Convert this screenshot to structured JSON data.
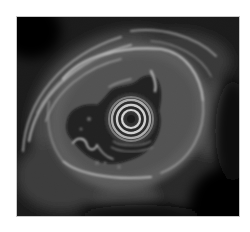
{
  "image": {
    "kind": "endoscopic ultrasound",
    "description": "Grayscale radial endoscopic ultrasound image showing a circular transducer artifact with concentric rings at center, surrounded by an irregular anechoic lumen and layered echogenic wall",
    "colors": {
      "background": "#ffffff",
      "field": "#050505",
      "tissue": "#6e6e6e",
      "bright_echo": "#d8d8d8",
      "ring_bright": "#e6e6e6",
      "ring_dark": "#0a0a0a"
    },
    "frame": {
      "x": 16,
      "y": 16,
      "width": 224,
      "height": 201
    },
    "transducer_center": {
      "x": 130,
      "y": 118
    }
  }
}
